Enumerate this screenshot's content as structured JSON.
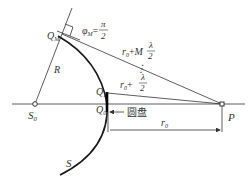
{
  "diagram": {
    "labels": {
      "source": "S",
      "source_sub": "0",
      "point": "P",
      "wavefront": "S",
      "radius": "R",
      "q0": "Q",
      "q0_sub": "0",
      "q1": "Q",
      "q1_sub": "1",
      "qm": "Q",
      "qm_sub": "M",
      "phase": "φ",
      "phase_sub": "M",
      "phase_eq": "=",
      "pi": "π",
      "two": "2",
      "r0": "r",
      "r0_sub": "0",
      "plus": "+",
      "M": "M",
      "lambda": "λ",
      "vdots": "⋮",
      "disk": "圆盘"
    },
    "colors": {
      "line": "#333333",
      "wavefront": "#1a1a1a",
      "background": "#ffffff"
    }
  }
}
